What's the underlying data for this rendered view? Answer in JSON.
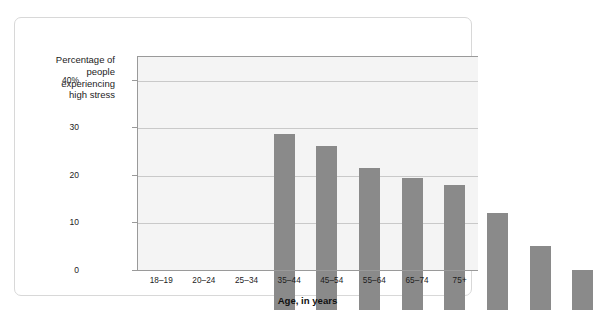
{
  "chart_data": {
    "type": "bar",
    "title": "",
    "xlabel": "Age, in years",
    "ylabel": "Percentage of\npeople\nexperiencing\nhigh stress",
    "categories": [
      "18–19",
      "20–24",
      "25–34",
      "35–44",
      "45–54",
      "55–64",
      "65–74",
      "75+"
    ],
    "values": [
      37.0,
      34.5,
      29.8,
      27.8,
      26.3,
      20.5,
      13.5,
      8.4
    ],
    "ylim": [
      0,
      45
    ],
    "yticks": [
      0,
      10,
      20,
      30,
      40
    ],
    "ytick_labels": [
      "0",
      "10",
      "20",
      "30",
      "40%"
    ],
    "grid": true,
    "legend": "none",
    "bar_color": "#8a8a8a",
    "plot_background": "#f4f4f4",
    "gridline_color": "#c9c9c9",
    "axis_color": "#9a9a9a"
  }
}
